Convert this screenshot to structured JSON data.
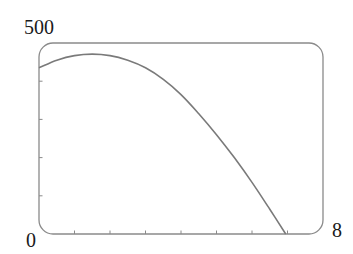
{
  "chart_data": {
    "type": "line",
    "title": "",
    "xlabel": "",
    "ylabel": "",
    "xlim": [
      0,
      8
    ],
    "ylim": [
      0,
      500
    ],
    "x_tick_labels": [
      "0",
      "8"
    ],
    "y_tick_labels": [
      "500"
    ],
    "x_ticks": [
      1,
      2,
      3,
      4,
      5,
      6,
      7
    ],
    "y_ticks": [
      100,
      200,
      300,
      400
    ],
    "grid": false,
    "legend": null,
    "series": [
      {
        "name": "curve",
        "x": [
          0,
          0.5,
          1,
          1.5,
          2,
          2.5,
          3,
          3.5,
          4,
          4.5,
          5,
          5.5,
          6,
          6.5,
          6.95
        ],
        "values": [
          435,
          455,
          467,
          471,
          467,
          455,
          435,
          405,
          365,
          315,
          260,
          200,
          135,
          65,
          0
        ]
      }
    ],
    "line_color": "#7a7a7a"
  },
  "labels": {
    "y_max": "500",
    "x_min": "0",
    "x_max": "8"
  }
}
